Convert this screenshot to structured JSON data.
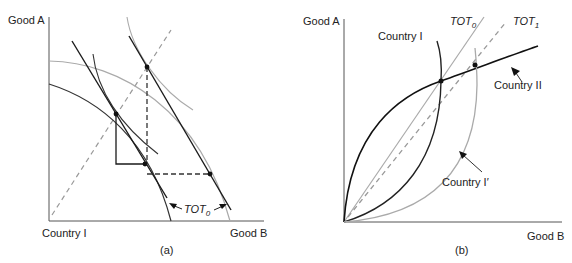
{
  "figure": {
    "panel_a": {
      "caption": "(a)",
      "y_axis_label": "Good A",
      "x_axis_label": "Good B",
      "origin_label": "Country I",
      "tot_label": "TOT",
      "tot_subscript": "0"
    },
    "panel_b": {
      "caption": "(b)",
      "y_axis_label": "Good A",
      "x_axis_label": "Good B",
      "curve_labels": {
        "country_1": "Country I",
        "country_2": "Country II",
        "country_1_prime": "Country I′"
      },
      "tot0_label": "TOT",
      "tot0_subscript": "0",
      "tot1_label": "TOT",
      "tot1_subscript": "1"
    },
    "colors": {
      "dark_line": "#1a1a1a",
      "gray_line": "#a8a8a8",
      "dashed_gray": "#999999",
      "axis": "#555555"
    }
  }
}
